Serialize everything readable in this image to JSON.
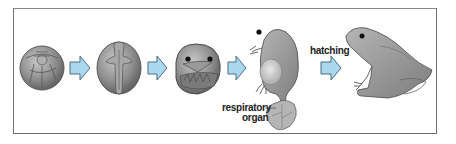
{
  "diagram": {
    "stages": [
      {
        "name": "egg-cleavage"
      },
      {
        "name": "neurula"
      },
      {
        "name": "embryo"
      },
      {
        "name": "embryo-with-respiratory-organ"
      },
      {
        "name": "adult-frog"
      }
    ],
    "labels": {
      "hatching": "hatching",
      "respiratory_line1": "respiratory",
      "respiratory_line2": "organ"
    },
    "colors": {
      "arrow_fill": "#a9d8f0",
      "arrow_stroke": "#4a6a80",
      "organism": "#8f8f8f",
      "frame": "#6e6e6e"
    }
  }
}
